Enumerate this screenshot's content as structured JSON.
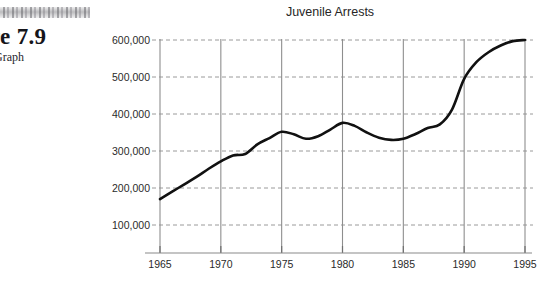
{
  "page": {
    "figure_label": "re 7.9",
    "figure_sublabel": "Graph",
    "smudge_icon": "scan-artifact"
  },
  "chart_data": {
    "type": "line",
    "title": "Juvenile Arrests",
    "xlabel": "",
    "ylabel": "",
    "xlim": [
      1965,
      1995
    ],
    "ylim": [
      0,
      600000
    ],
    "grid": true,
    "legend": null,
    "x_ticks": [
      "1965",
      "1970",
      "1975",
      "1980",
      "1985",
      "1990",
      "1995"
    ],
    "y_ticks": [
      "100,000",
      "200,000",
      "300,000",
      "400,000",
      "500,000",
      "600,000"
    ],
    "x_tick_values": [
      1965,
      1970,
      1975,
      1980,
      1985,
      1990,
      1995
    ],
    "y_tick_values": [
      100000,
      200000,
      300000,
      400000,
      500000,
      600000
    ],
    "series": [
      {
        "name": "Juvenile Arrests",
        "color": "#111111",
        "x": [
          1965,
          1966,
          1967,
          1968,
          1969,
          1970,
          1971,
          1972,
          1973,
          1974,
          1975,
          1976,
          1977,
          1978,
          1979,
          1980,
          1981,
          1982,
          1983,
          1984,
          1985,
          1986,
          1987,
          1988,
          1989,
          1990,
          1991,
          1992,
          1993,
          1994,
          1995
        ],
        "values": [
          170000,
          190000,
          210000,
          230000,
          252000,
          272000,
          288000,
          292000,
          318000,
          335000,
          352000,
          345000,
          333000,
          340000,
          358000,
          376000,
          368000,
          350000,
          336000,
          330000,
          333000,
          346000,
          362000,
          372000,
          412000,
          495000,
          540000,
          567000,
          585000,
          597000,
          600000
        ]
      }
    ]
  }
}
